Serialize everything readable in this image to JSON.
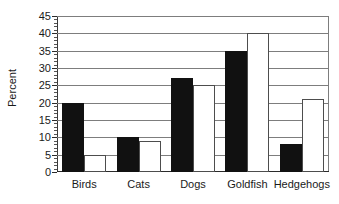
{
  "chart_data": {
    "type": "bar",
    "title": "",
    "xlabel": "",
    "ylabel": "Percent",
    "ylim": [
      0,
      45
    ],
    "ytick_step": 5,
    "yminor_step": 1,
    "grid": true,
    "legend": "none",
    "categories": [
      "Birds",
      "Cats",
      "Dogs",
      "Goldfish",
      "Hedgehogs"
    ],
    "ytick_labels": [
      "0",
      "5",
      "10",
      "15",
      "20",
      "25",
      "30",
      "35",
      "40",
      "45"
    ],
    "series": [
      {
        "name": "series-1",
        "color": "#111111",
        "style": "filled-black",
        "values": [
          20,
          10,
          27,
          35,
          8
        ]
      },
      {
        "name": "series-2",
        "color": "#ffffff",
        "style": "open-white",
        "values": [
          5,
          9,
          25,
          40,
          21
        ]
      }
    ]
  },
  "colors": {
    "series_dark": "#111111",
    "series_light": "#ffffff",
    "grid": "#7d7d7d",
    "axis": "#2b2b2b",
    "text": "#1a1a1a",
    "background": "#ffffff"
  }
}
